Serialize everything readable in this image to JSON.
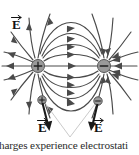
{
  "figure": {
    "caption": "harges experience electrostati",
    "colors": {
      "background": "#ffffff",
      "field_line": "#4a4a4a",
      "charge_fill": "#9a9a9a",
      "charge_stroke": "#555555",
      "label_text": "#1a1a1a",
      "leader_line": "#b9b9b9",
      "caption_text": "#2b2b2b"
    },
    "source_charges": [
      {
        "id": "positive-source-charge",
        "sign": "+",
        "cx": 38,
        "cy": 66,
        "r": 6.5
      },
      {
        "id": "negative-source-charge",
        "sign": "−",
        "cx": 104,
        "cy": 66,
        "r": 6.5
      }
    ],
    "test_charges": [
      {
        "id": "positive-test-charge",
        "sign": "+",
        "cx": 42,
        "cy": 100,
        "r": 4.2
      },
      {
        "id": "negative-test-charge",
        "sign": "−",
        "cx": 98,
        "cy": 101,
        "r": 4.2
      }
    ],
    "field_labels": [
      {
        "id": "field-label-top-left",
        "text": "E",
        "x": 12,
        "y": 26
      },
      {
        "id": "field-label-bottom-left",
        "text": "E",
        "x": 38,
        "y": 129
      },
      {
        "id": "field-label-bottom-right",
        "text": "E",
        "x": 94,
        "y": 129
      }
    ],
    "vector_accent": "arrow-overbar",
    "leader_apex": {
      "x": 70,
      "y": 138
    }
  }
}
